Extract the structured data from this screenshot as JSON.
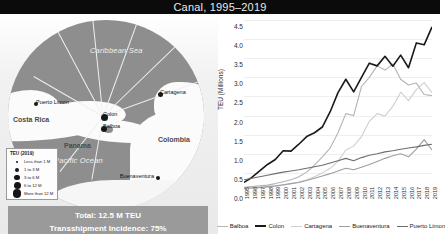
{
  "title": "Canal, 1995–2019",
  "map": {
    "sea_labels": [
      {
        "name": "Caribbean Sea"
      },
      {
        "name": "Pacific Ocean"
      }
    ],
    "countries": [
      {
        "name": "Costa Rica"
      },
      {
        "name": "Panama"
      },
      {
        "name": "Colombia"
      }
    ],
    "cities": [
      {
        "name": "Puerto Limon"
      },
      {
        "name": "Colon"
      },
      {
        "name": "Balboa"
      },
      {
        "name": "Cartagena"
      },
      {
        "name": "Buenaventura"
      }
    ],
    "legend": {
      "title": "TEU (2019)",
      "classes": [
        {
          "label": "Less than 1 M",
          "size": 2
        },
        {
          "label": "1 to 3 M",
          "size": 4
        },
        {
          "label": "3 to 6 M",
          "size": 5.5
        },
        {
          "label": "6 to 12 M",
          "size": 7
        },
        {
          "label": "More than 12 M",
          "size": 8.5
        }
      ]
    },
    "banner": {
      "total": "Total: 12.5 M TEU",
      "transshipment": "Transshipment Incidence: 75%"
    }
  },
  "chart_data": {
    "type": "line",
    "title": "",
    "xlabel": "",
    "ylabel": "TEU (Millions)",
    "ylim": [
      0,
      4.5
    ],
    "yticks": [
      0.0,
      0.5,
      1.0,
      1.5,
      2.0,
      2.5,
      3.0,
      3.5,
      4.0,
      4.5
    ],
    "ytick_labels": [
      "0.0",
      "0.5",
      "1.0",
      "1.5",
      "2.0",
      "2.5",
      "3.0",
      "3.5",
      "4.0",
      "4.5"
    ],
    "grid": true,
    "legend_position": "bottom",
    "categories": [
      "1995",
      "1996",
      "1997",
      "1998",
      "1999",
      "2000",
      "2001",
      "2002",
      "2003",
      "2004",
      "2005",
      "2006",
      "2007",
      "2008",
      "2009",
      "2010",
      "2011",
      "2012",
      "2013",
      "2014",
      "2015",
      "2016",
      "2017",
      "2018",
      "2019"
    ],
    "series": [
      {
        "name": "Balboa",
        "color": "#b4b4b4",
        "values": [
          0.12,
          0.14,
          0.16,
          0.18,
          0.22,
          0.27,
          0.32,
          0.4,
          0.52,
          0.7,
          0.92,
          1.15,
          1.55,
          2.05,
          2.0,
          2.76,
          3.0,
          3.3,
          3.19,
          3.35,
          2.95,
          2.8,
          2.85,
          2.55,
          2.52
        ]
      },
      {
        "name": "Colon",
        "color": "#1a1a1a",
        "values": [
          0.25,
          0.38,
          0.55,
          0.72,
          0.85,
          1.08,
          1.07,
          1.25,
          1.45,
          1.55,
          1.7,
          2.1,
          2.6,
          2.95,
          2.62,
          3.0,
          3.37,
          3.3,
          3.55,
          3.29,
          3.58,
          3.25,
          3.9,
          3.85,
          4.32
        ]
      },
      {
        "name": "Cartagena",
        "color": "#cfcfcf",
        "values": [
          0.08,
          0.09,
          0.11,
          0.13,
          0.15,
          0.18,
          0.22,
          0.26,
          0.32,
          0.4,
          0.5,
          0.62,
          0.8,
          1.1,
          1.2,
          1.45,
          1.85,
          2.05,
          1.99,
          2.24,
          2.61,
          2.39,
          2.68,
          2.86,
          2.6
        ]
      },
      {
        "name": "Buenaventura",
        "color": "#9e9e9e",
        "values": [
          0.1,
          0.11,
          0.12,
          0.14,
          0.16,
          0.19,
          0.22,
          0.25,
          0.3,
          0.36,
          0.42,
          0.48,
          0.55,
          0.62,
          0.58,
          0.65,
          0.72,
          0.8,
          0.88,
          0.95,
          1.0,
          0.92,
          1.12,
          1.37,
          1.1
        ]
      },
      {
        "name": "Puerto Limon",
        "color": "#6e6e6e",
        "values": [
          0.32,
          0.36,
          0.4,
          0.44,
          0.48,
          0.52,
          0.55,
          0.58,
          0.62,
          0.66,
          0.7,
          0.76,
          0.82,
          0.88,
          0.82,
          0.9,
          0.96,
          1.0,
          1.05,
          1.08,
          1.12,
          1.15,
          1.18,
          1.22,
          1.25
        ]
      }
    ]
  }
}
